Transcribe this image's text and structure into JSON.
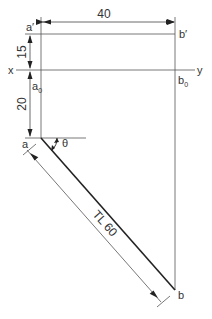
{
  "diagram": {
    "labels": {
      "a_prime": "a′",
      "b_prime": "b′",
      "x_axis": "x",
      "y_axis": "y",
      "a0": "a",
      "a0_sub": "0",
      "b0": "b",
      "b0_sub": "0",
      "a": "a",
      "b": "b",
      "theta": "θ"
    },
    "dimensions": {
      "horizontal_distance": "40",
      "a_prime_above_xy": "15",
      "a_below_xy": "20",
      "true_length": "TL 60"
    },
    "colors": {
      "line": "#555555",
      "thick_line": "#222222",
      "text": "#333333"
    }
  }
}
